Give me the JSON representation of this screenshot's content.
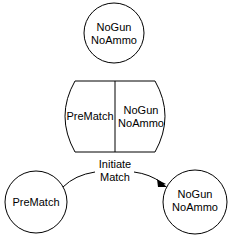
{
  "diagram": {
    "top_state": {
      "line1": "NoGun",
      "line2": "NoAmmo"
    },
    "composite_state": {
      "left": "PreMatch",
      "right_line1": "NoGun",
      "right_line2": "NoAmmo"
    },
    "source_state": {
      "label": "PreMatch"
    },
    "target_state": {
      "line1": "NoGun",
      "line2": "NoAmmo"
    },
    "transition": {
      "line1": "Initiate",
      "line2": "Match"
    }
  }
}
